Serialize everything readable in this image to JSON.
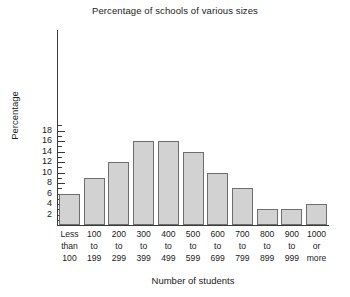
{
  "chart_data": {
    "type": "bar",
    "title": "Percentage of schools of various sizes",
    "xlabel": "Number of students",
    "ylabel": "Percentage",
    "categories": [
      "Less than 100",
      "100 to 199",
      "200 to 299",
      "300 to 399",
      "400 to 499",
      "500 to 599",
      "600 to 699",
      "700 to 799",
      "800 to 899",
      "900 to 999",
      "1000 or more"
    ],
    "category_lines": [
      [
        "Less",
        "than",
        "100"
      ],
      [
        "100",
        "to",
        "199"
      ],
      [
        "200",
        "to",
        "299"
      ],
      [
        "300",
        "to",
        "399"
      ],
      [
        "400",
        "to",
        "499"
      ],
      [
        "500",
        "to",
        "599"
      ],
      [
        "600",
        "to",
        "699"
      ],
      [
        "700",
        "to",
        "799"
      ],
      [
        "800",
        "to",
        "899"
      ],
      [
        "900",
        "to",
        "999"
      ],
      [
        "1000",
        "or",
        "more"
      ]
    ],
    "values": [
      6,
      9,
      12,
      16,
      16,
      14,
      10,
      7,
      3,
      3,
      4
    ],
    "ylim": [
      0,
      19
    ],
    "ytick_major": [
      2,
      4,
      6,
      8,
      10,
      12,
      14,
      16,
      18
    ],
    "ytick_minor": [
      1,
      3,
      5,
      7,
      9,
      11,
      13,
      15,
      17,
      19
    ],
    "ytick_labels": [
      "2",
      "4",
      "6",
      "8",
      "10",
      "12",
      "14",
      "16",
      "18"
    ],
    "grid": false,
    "legend": null,
    "bar_fill_color": "#d2d2d2",
    "bar_border_color": "#6e6e6e",
    "axis_color": "#3a3a3a",
    "background_color": "#ffffff"
  }
}
